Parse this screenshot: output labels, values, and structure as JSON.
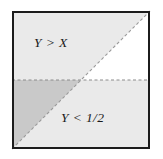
{
  "figure": {
    "name": "unit-square-probability-region-diagram",
    "background_color": "#ffffff",
    "square": {
      "x": 12,
      "y": 11,
      "width": 138,
      "height": 138,
      "border_color": "#1c1c1c",
      "border_width": 2,
      "fill_color": "#ffffff"
    },
    "colors": {
      "light_shade": "#eaeaea",
      "dark_shade": "#c9c9c9",
      "unshaded": "#ffffff",
      "border": "#1c1c1c",
      "dashed_line": "#8c8c8c",
      "text": "#1a1a1a"
    },
    "regions": [
      {
        "name": "region-y-greater-than-x",
        "shape": "triangle",
        "description": "upper-left triangle above diagonal and above midline",
        "shade": "light",
        "color": "#eaeaea"
      },
      {
        "name": "region-y-less-than-half",
        "shape": "rectangle-minus-overlap",
        "description": "lower half band below midline",
        "shade": "light",
        "color": "#eaeaea"
      },
      {
        "name": "region-overlap",
        "shape": "triangle",
        "description": "lower-left overlap of both events",
        "shade": "dark",
        "color": "#c9c9c9"
      },
      {
        "name": "region-unshaded",
        "shape": "triangle",
        "description": "upper-right triangle below diagonal and above midline",
        "shade": "none",
        "color": "#ffffff"
      }
    ],
    "lines": [
      {
        "name": "diagonal-line-y-equals-x",
        "style": "dashed",
        "from": [
          12,
          149
        ],
        "to": [
          150,
          11
        ],
        "color": "#9a9a9a",
        "dash": "3 2.5"
      },
      {
        "name": "horizontal-line-y-equals-half",
        "style": "dashed",
        "from": [
          12,
          80
        ],
        "to": [
          150,
          80
        ],
        "color": "#8c8c8c",
        "dash": "3 2.5"
      }
    ],
    "labels": {
      "upper": {
        "text": "Y > X",
        "x": 34,
        "y": 47
      },
      "lower": {
        "text": "Y < 1/2",
        "x": 61,
        "y": 122
      }
    }
  }
}
